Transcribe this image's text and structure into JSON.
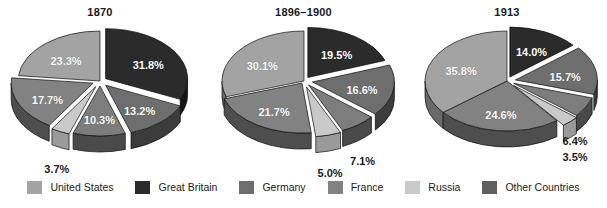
{
  "chart_data": [
    {
      "type": "pie",
      "title": "1870",
      "categories": [
        "Great Britain",
        "Germany",
        "Russia",
        "Other Countries",
        "France",
        "United States"
      ],
      "values": [
        31.8,
        13.2,
        3.7,
        10.3,
        17.7,
        23.3
      ],
      "labels": [
        "31.8%",
        "13.2%",
        "3.7%",
        "10.3%",
        "17.7%",
        "23.3%"
      ],
      "xlabel": "",
      "ylabel": "",
      "legend_position": "bottom",
      "exploded": true,
      "three_d": true
    },
    {
      "type": "pie",
      "title": "1896–1900",
      "categories": [
        "Great Britain",
        "Germany",
        "Russia",
        "Other Countries",
        "France",
        "United States"
      ],
      "values": [
        19.5,
        16.6,
        5.0,
        7.1,
        21.7,
        30.1
      ],
      "labels": [
        "19.5%",
        "16.6%",
        "5.0%",
        "7.1%",
        "21.7%",
        "30.1%"
      ],
      "xlabel": "",
      "ylabel": "",
      "legend_position": "bottom",
      "exploded": true,
      "three_d": true
    },
    {
      "type": "pie",
      "title": "1913",
      "categories": [
        "Great Britain",
        "Germany",
        "Russia",
        "Other Countries",
        "France",
        "United States"
      ],
      "values": [
        14.0,
        15.7,
        3.5,
        6.4,
        24.6,
        35.8
      ],
      "labels": [
        "14.0%",
        "15.7%",
        "3.5%",
        "6.4%",
        "24.6%",
        "35.8%"
      ],
      "xlabel": "",
      "ylabel": "",
      "legend_position": "bottom",
      "exploded": true,
      "three_d": true
    }
  ],
  "charts": [
    {
      "title": "1870",
      "slices": [
        {
          "key": "great-britain",
          "label": "31.8%",
          "value": 31.8,
          "color": "#2b2b2b",
          "side": "#151515",
          "explode": 7,
          "dark_text": false,
          "outside": false
        },
        {
          "key": "germany",
          "label": "13.2%",
          "value": 13.2,
          "color": "#6e6e6e",
          "side": "#3c3c3c",
          "explode": 9,
          "dark_text": false,
          "outside": false
        },
        {
          "key": "other-countries",
          "label": "10.3%",
          "value": 10.3,
          "color": "#7d7d7d",
          "side": "#4a4a4a",
          "explode": 8,
          "dark_text": false,
          "outside": false
        },
        {
          "key": "russia",
          "label": "3.7%",
          "value": 3.7,
          "color": "#c9c9c9",
          "side": "#9a9a9a",
          "explode": 10,
          "dark_text": true,
          "outside": true
        },
        {
          "key": "france",
          "label": "17.7%",
          "value": 17.7,
          "color": "#828282",
          "side": "#4e4e4e",
          "explode": 8,
          "dark_text": false,
          "outside": false
        },
        {
          "key": "united-states",
          "label": "23.3%",
          "value": 23.3,
          "color": "#a3a3a3",
          "side": "#6a6a6a",
          "explode": 0,
          "dark_text": false,
          "outside": false
        }
      ]
    },
    {
      "title": "1896–1900",
      "slices": [
        {
          "key": "great-britain",
          "label": "19.5%",
          "value": 19.5,
          "color": "#2b2b2b",
          "side": "#151515",
          "explode": 7,
          "dark_text": false,
          "outside": false
        },
        {
          "key": "germany",
          "label": "16.6%",
          "value": 16.6,
          "color": "#6e6e6e",
          "side": "#3c3c3c",
          "explode": 9,
          "dark_text": false,
          "outside": false
        },
        {
          "key": "other-countries",
          "label": "7.1%",
          "value": 7.1,
          "color": "#7d7d7d",
          "side": "#4a4a4a",
          "explode": 8,
          "dark_text": true,
          "outside": true
        },
        {
          "key": "russia",
          "label": "5.0%",
          "value": 5.0,
          "color": "#c9c9c9",
          "side": "#9a9a9a",
          "explode": 10,
          "dark_text": true,
          "outside": true
        },
        {
          "key": "france",
          "label": "21.7%",
          "value": 21.7,
          "color": "#828282",
          "side": "#4e4e4e",
          "explode": 4,
          "dark_text": false,
          "outside": false
        },
        {
          "key": "united-states",
          "label": "30.1%",
          "value": 30.1,
          "color": "#a3a3a3",
          "side": "#6a6a6a",
          "explode": 0,
          "dark_text": false,
          "outside": false
        }
      ]
    },
    {
      "title": "1913",
      "slices": [
        {
          "key": "great-britain",
          "label": "14.0%",
          "value": 14.0,
          "color": "#2b2b2b",
          "side": "#151515",
          "explode": 7,
          "dark_text": false,
          "outside": false
        },
        {
          "key": "germany",
          "label": "15.7%",
          "value": 15.7,
          "color": "#6e6e6e",
          "side": "#3c3c3c",
          "explode": 9,
          "dark_text": false,
          "outside": false
        },
        {
          "key": "other-countries",
          "label": "6.4%",
          "value": 6.4,
          "color": "#7d7d7d",
          "side": "#4a4a4a",
          "explode": 8,
          "dark_text": true,
          "outside": true
        },
        {
          "key": "russia",
          "label": "3.5%",
          "value": 3.5,
          "color": "#c9c9c9",
          "side": "#9a9a9a",
          "explode": 10,
          "dark_text": true,
          "outside": true
        },
        {
          "key": "france",
          "label": "24.6%",
          "value": 24.6,
          "color": "#828282",
          "side": "#4e4e4e",
          "explode": 0,
          "dark_text": false,
          "outside": false
        },
        {
          "key": "united-states",
          "label": "35.8%",
          "value": 35.8,
          "color": "#a3a3a3",
          "side": "#6a6a6a",
          "explode": 0,
          "dark_text": false,
          "outside": false
        }
      ]
    }
  ],
  "legend": {
    "items": [
      {
        "key": "united-states",
        "label": "United States",
        "color": "#a3a3a3"
      },
      {
        "key": "great-britain",
        "label": "Great Britain",
        "color": "#2b2b2b"
      },
      {
        "key": "germany",
        "label": "Germany",
        "color": "#6e6e6e"
      },
      {
        "key": "france",
        "label": "France",
        "color": "#828282"
      },
      {
        "key": "russia",
        "label": "Russia",
        "color": "#c9c9c9"
      },
      {
        "key": "other-countries",
        "label": "Other Countries",
        "color": "#5f5f5f"
      }
    ]
  }
}
